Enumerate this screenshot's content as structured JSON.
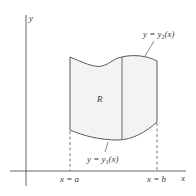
{
  "diagram": {
    "type": "region-between-curves",
    "colors": {
      "background": "#ffffff",
      "axis": "#555555",
      "curve": "#5a5a5a",
      "region_fill": "#f2f2f2",
      "text": "#3a3a3a"
    },
    "axes": {
      "x_label": "x",
      "y_label": "y"
    },
    "region": {
      "label": "R"
    },
    "curves": {
      "upper": {
        "prefix": "y = y",
        "sub": "2",
        "suffix": "(x)"
      },
      "lower": {
        "prefix": "y = y",
        "sub": "1",
        "suffix": "(x)"
      }
    },
    "bounds": {
      "left": "x = a",
      "right": "x = b"
    }
  }
}
